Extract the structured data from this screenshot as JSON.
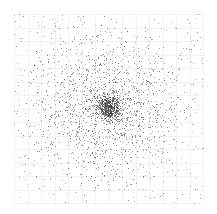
{
  "chart_data": {
    "type": "scatter",
    "title": "",
    "xlabel": "",
    "ylabel": "",
    "grid": true,
    "legend": null,
    "plot_area_px": {
      "x0": 14,
      "y0": 14,
      "x1": 203,
      "y1": 203
    },
    "grid_divisions": 14,
    "colors": {
      "background": "#ffffff",
      "grid": "#f2f2f2",
      "point": "#555555"
    },
    "distribution": {
      "kind": "gaussian-cluster",
      "center_px": [
        108,
        107
      ],
      "core_sigma_px": 6,
      "halo_sigma_px": 38,
      "core_count": 500,
      "halo_count": 1600,
      "uniform_background_count": 350,
      "seed": 7
    },
    "series": [
      {
        "name": "points",
        "point_size_px": 1
      }
    ]
  }
}
